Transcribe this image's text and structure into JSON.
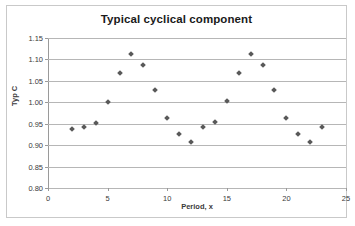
{
  "chart_data": {
    "type": "scatter",
    "title": "Typical cyclical component",
    "xlabel": "Period, x",
    "ylabel": "Typ C",
    "xlim": [
      0,
      25
    ],
    "ylim": [
      0.8,
      1.15
    ],
    "xticks": [
      "0",
      "5",
      "10",
      "15",
      "20",
      "25"
    ],
    "xtick_values": [
      0,
      5,
      10,
      15,
      20,
      25
    ],
    "yticks": [
      "0.80",
      "0.85",
      "0.90",
      "0.95",
      "1.00",
      "1.05",
      "1.10",
      "1.15"
    ],
    "ytick_values": [
      0.8,
      0.85,
      0.9,
      0.95,
      1.0,
      1.05,
      1.1,
      1.15
    ],
    "grid": "horizontal",
    "legend": "none",
    "marker": "diamond",
    "marker_color": "#595959",
    "x": [
      2,
      3,
      4,
      5,
      6,
      7,
      8,
      9,
      10,
      11,
      12,
      13,
      14,
      15,
      16,
      17,
      18,
      19,
      20,
      21,
      22,
      23
    ],
    "values": [
      0.938,
      0.942,
      0.952,
      1.001,
      1.068,
      1.112,
      1.086,
      1.029,
      0.963,
      0.925,
      0.907,
      0.942,
      0.953,
      1.002,
      1.069,
      1.112,
      1.086,
      1.029,
      0.963,
      0.925,
      0.907,
      0.942
    ]
  }
}
